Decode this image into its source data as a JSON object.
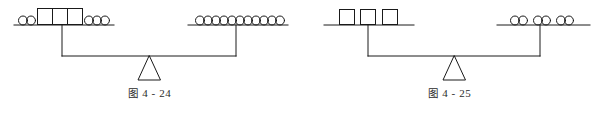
{
  "page": {
    "background_color": "#ffffff",
    "stroke_color": "#1a1a1a",
    "width": 599,
    "height": 113
  },
  "figures": [
    {
      "id": "figure-4-24",
      "caption_label": "图",
      "caption_number": "4 - 24",
      "caption_full": "图 4 - 24",
      "balance_state": "level",
      "left_pan": {
        "name": "left-pan",
        "items": [
          {
            "type": "circle",
            "count": 2,
            "group": "left-circles"
          },
          {
            "type": "box",
            "count": 3,
            "group": "adjoined-boxes"
          },
          {
            "type": "circle",
            "count": 3,
            "group": "right-circles"
          }
        ],
        "circle_count": 5,
        "box_count": 3
      },
      "right_pan": {
        "name": "right-pan",
        "items": [
          {
            "type": "circle",
            "count": 11,
            "group": "circles-row"
          }
        ],
        "circle_count": 11,
        "box_count": 0
      }
    },
    {
      "id": "figure-4-25",
      "caption_label": "图",
      "caption_number": "4 - 25",
      "caption_full": "图 4 - 25",
      "balance_state": "level",
      "left_pan": {
        "name": "left-pan",
        "items": [
          {
            "type": "box",
            "count": 3,
            "group": "separated-boxes"
          }
        ],
        "circle_count": 0,
        "box_count": 3
      },
      "right_pan": {
        "name": "right-pan",
        "items": [
          {
            "type": "circle",
            "count": 2,
            "group": "pair-1"
          },
          {
            "type": "circle",
            "count": 2,
            "group": "pair-2"
          },
          {
            "type": "circle",
            "count": 2,
            "group": "pair-3"
          }
        ],
        "circle_count": 6,
        "box_count": 0
      }
    }
  ]
}
